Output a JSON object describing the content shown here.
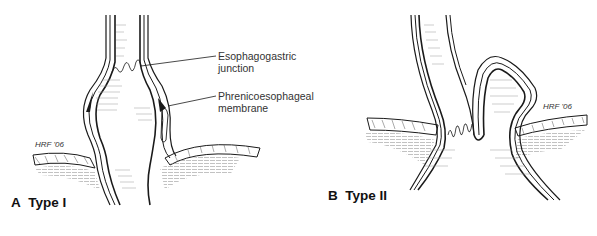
{
  "figure": {
    "panels": [
      {
        "id": "A",
        "letter": "A",
        "title": "Type I",
        "signature": "HRF '06",
        "annotations": [
          {
            "text_line1": "Esophagogastric",
            "text_line2": "junction"
          },
          {
            "text_line1": "Phrenicoesophageal",
            "text_line2": "membrane"
          }
        ]
      },
      {
        "id": "B",
        "letter": "B",
        "title": "Type II",
        "signature": "HRF '06"
      }
    ],
    "colors": {
      "ink": "#1a1a1a",
      "hatch": "#888888",
      "background": "#ffffff"
    }
  }
}
